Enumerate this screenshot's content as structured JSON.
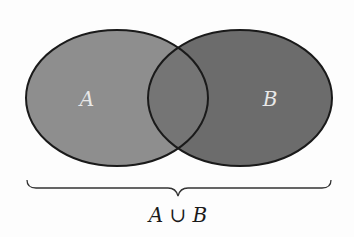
{
  "diagram": {
    "type": "venn",
    "sets": [
      {
        "id": "A",
        "label": "A",
        "fill": "#8e8e8e"
      },
      {
        "id": "B",
        "label": "B",
        "fill": "#6c6c6c"
      }
    ],
    "intersection_fill": "#757575",
    "stroke": "#1a1a1a",
    "label_color": "#e8e8e8",
    "brace_label": "A ∪ B"
  }
}
